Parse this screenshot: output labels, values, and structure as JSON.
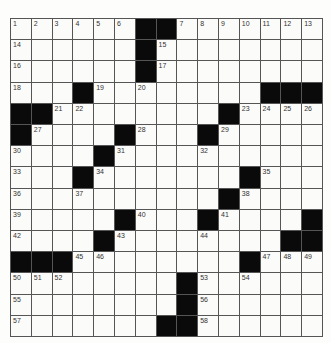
{
  "puzzle": {
    "rows": 15,
    "cols": 15,
    "colors": {
      "block": "#0a0a0a",
      "cell": "#fbfbf9",
      "line": "#555555",
      "number": "#333333"
    },
    "grid": [
      [
        "1",
        "2",
        "3",
        "4",
        "5",
        "6",
        "#",
        "#",
        "7",
        "8",
        "9",
        "10",
        "11",
        "12",
        "13"
      ],
      [
        "14",
        "",
        "",
        "",
        "",
        "",
        "#",
        "15",
        "",
        "",
        "",
        "",
        "",
        "",
        ""
      ],
      [
        "16",
        "",
        "",
        "",
        "",
        "",
        "#",
        "17",
        "",
        "",
        "",
        "",
        "",
        "",
        ""
      ],
      [
        "18",
        "",
        "",
        "#",
        "19",
        "",
        "20",
        "",
        "",
        "",
        "",
        "",
        "#",
        "#",
        "#"
      ],
      [
        "#",
        "#",
        "21",
        "22",
        "",
        "",
        "",
        "",
        "",
        "",
        "#",
        "23",
        "24",
        "25",
        "26"
      ],
      [
        "#",
        "27",
        "",
        "",
        "",
        "#",
        "28",
        "",
        "",
        "#",
        "29",
        "",
        "",
        "",
        ""
      ],
      [
        "30",
        "",
        "",
        "",
        "#",
        "31",
        "",
        "",
        "",
        "32",
        "",
        "",
        "",
        "",
        ""
      ],
      [
        "33",
        "",
        "",
        "#",
        "34",
        "",
        "",
        "",
        "",
        "",
        "",
        "#",
        "35",
        "",
        ""
      ],
      [
        "36",
        "",
        "",
        "37",
        "",
        "",
        "",
        "",
        "",
        "",
        "#",
        "38",
        "",
        "",
        ""
      ],
      [
        "39",
        "",
        "",
        "",
        "",
        "#",
        "40",
        "",
        "",
        "#",
        "41",
        "",
        "",
        "",
        "#"
      ],
      [
        "42",
        "",
        "",
        "",
        "#",
        "43",
        "",
        "",
        "",
        "44",
        "",
        "",
        "",
        "#",
        "#"
      ],
      [
        "#",
        "#",
        "#",
        "45",
        "46",
        "",
        "",
        "",
        "",
        "",
        "",
        "#",
        "47",
        "48",
        "49"
      ],
      [
        "50",
        "51",
        "52",
        "",
        "",
        "",
        "",
        "",
        "#",
        "53",
        "",
        "54",
        "",
        "",
        ""
      ],
      [
        "55",
        "",
        "",
        "",
        "",
        "",
        "",
        "",
        "#",
        "56",
        "",
        "",
        "",
        "",
        ""
      ],
      [
        "57",
        "",
        "",
        "",
        "",
        "",
        "",
        "#",
        "#",
        "58",
        "",
        "",
        "",
        "",
        ""
      ]
    ]
  }
}
